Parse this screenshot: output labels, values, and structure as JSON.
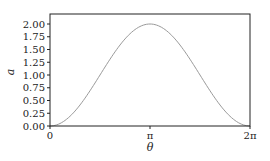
{
  "chart_data": {
    "type": "line",
    "title": "",
    "xlabel": "θ",
    "ylabel": "a",
    "xlim": [
      0,
      6.283185
    ],
    "ylim": [
      0,
      2.1
    ],
    "grid": false,
    "legend": null,
    "x_ticks": [
      {
        "value": 0,
        "label": "0"
      },
      {
        "value": 3.141593,
        "label": "π"
      },
      {
        "value": 6.283185,
        "label": "2π"
      }
    ],
    "y_ticks": [
      {
        "value": 0.0,
        "label": "0.00"
      },
      {
        "value": 0.25,
        "label": "0.25"
      },
      {
        "value": 0.5,
        "label": "0.50"
      },
      {
        "value": 0.75,
        "label": "0.75"
      },
      {
        "value": 1.0,
        "label": "1.00"
      },
      {
        "value": 1.25,
        "label": "1.25"
      },
      {
        "value": 1.5,
        "label": "1.50"
      },
      {
        "value": 1.75,
        "label": "1.75"
      },
      {
        "value": 2.0,
        "label": "2.00"
      }
    ],
    "series": [
      {
        "name": "a(θ) = 1 − cos θ",
        "color": "#9a9a9a",
        "x": [
          0,
          0.785398,
          1.570796,
          2.356194,
          3.141593,
          3.926991,
          4.712389,
          5.497787,
          6.283185
        ],
        "y": [
          0.0,
          0.293,
          1.0,
          1.707,
          2.0,
          1.707,
          1.0,
          0.293,
          0.0
        ]
      }
    ]
  },
  "axes": {
    "frame_color": "#222222",
    "curve_color": "#9a9a9a"
  }
}
